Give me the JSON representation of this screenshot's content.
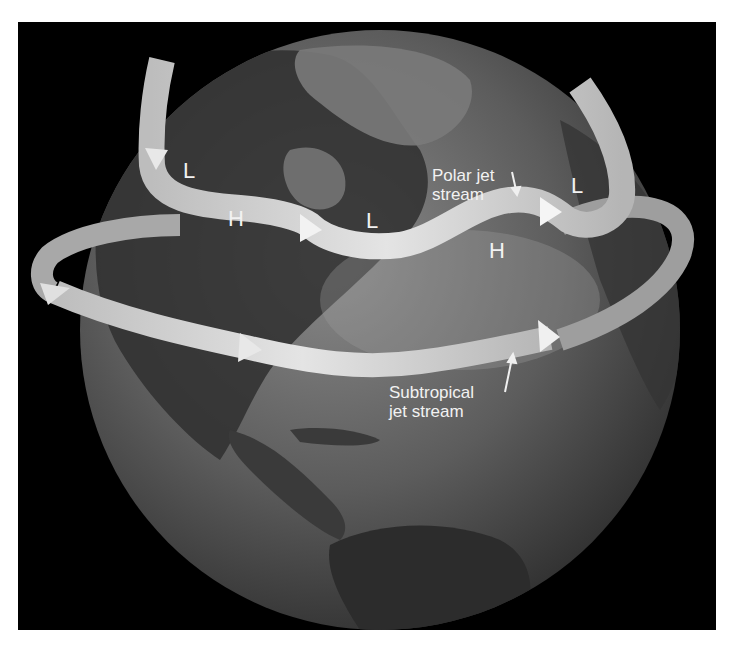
{
  "figure": {
    "background_color": "#000000",
    "globe_color": "#5a5a5a",
    "jet_color": "#c8c8c8"
  },
  "labels": {
    "polar_jet": "Polar jet stream",
    "polar_jet_line1": "Polar jet",
    "polar_jet_line2": "stream",
    "subtropical_jet": "Subtropical jet stream",
    "subtropical_jet_line1": "Subtropical",
    "subtropical_jet_line2": "jet stream"
  },
  "pressure_systems": [
    {
      "type": "L",
      "label": "L",
      "x": 183,
      "y": 160
    },
    {
      "type": "H",
      "label": "H",
      "x": 228,
      "y": 208
    },
    {
      "type": "L",
      "label": "L",
      "x": 366,
      "y": 210
    },
    {
      "type": "H",
      "label": "H",
      "x": 489,
      "y": 240
    },
    {
      "type": "L",
      "label": "L",
      "x": 571,
      "y": 175
    }
  ]
}
